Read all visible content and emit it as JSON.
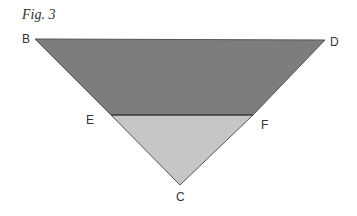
{
  "figure": {
    "caption": "Fig. 3"
  },
  "diagram": {
    "points": {
      "B": {
        "label": "B",
        "x": 35,
        "y": 39
      },
      "D": {
        "label": "D",
        "x": 325,
        "y": 40
      },
      "C": {
        "label": "C",
        "x": 180,
        "y": 185
      },
      "E": {
        "label": "E",
        "x": 111,
        "y": 115
      },
      "F": {
        "label": "F",
        "x": 253,
        "y": 115
      }
    },
    "regions": [
      {
        "name": "trapezoid-BDFE",
        "vertices": [
          "B",
          "D",
          "F",
          "E"
        ],
        "fill": "#7d7d7d"
      },
      {
        "name": "triangle-EFC",
        "vertices": [
          "E",
          "F",
          "C"
        ],
        "fill": "#c6c6c6"
      }
    ],
    "segments": [
      {
        "from": "E",
        "to": "F",
        "stroke": "#333333"
      }
    ],
    "colors": {
      "dark_fill": "#7d7d7d",
      "light_fill": "#c6c6c6",
      "edge": "#444444"
    }
  }
}
